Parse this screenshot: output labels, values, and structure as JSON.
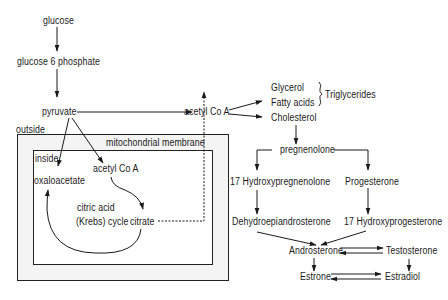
{
  "diagram": {
    "glycolysis": {
      "glucose": "glucose",
      "glucose6p": "glucose 6 phosphate",
      "pyruvate": "pyruvate"
    },
    "compartments": {
      "outside": "outside",
      "membrane": "mitochondrial membrane",
      "inside": "inside"
    },
    "mito": {
      "oxaloacetate": "oxaloacetate",
      "acetyl_coa_inner": "acetyl Co A",
      "cycle_line1": "citric acid",
      "cycle_line2": "(Krebs) cycle",
      "citrate": "citrate"
    },
    "cytosol": {
      "acetyl_coa": "acetyl Co A",
      "glycerol": "Glycerol",
      "fatty_acids": "Fatty acids",
      "triglycerides": "Triglycerides",
      "cholesterol": "Cholesterol"
    },
    "steroids": {
      "pregnenolone": "pregnenolone",
      "hydroxypregnenolone": "17 Hydroxypregnenolone",
      "progesterone": "Progesterone",
      "dhea": "Dehydroepiandrosterone",
      "hydroxyprogesterone": "17 Hydroxyprogesterone",
      "androsterone": "Androsterone",
      "testosterone": "Testosterone",
      "estrone": "Estrone",
      "estradiol": "Estradiol"
    },
    "colors": {
      "line": "#1a1a1a",
      "membrane_fill": "#f4f4f4",
      "background": "#ffffff"
    }
  }
}
